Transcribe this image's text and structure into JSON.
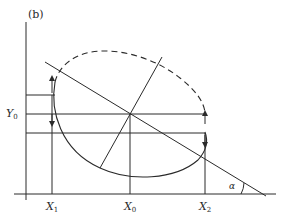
{
  "figure": {
    "panel_label": "(b)",
    "colors": {
      "ink": "#2a2a2a",
      "background": "#ffffff"
    },
    "axes": {
      "x_tick_labels": [
        {
          "base": "X",
          "sub": "1"
        },
        {
          "base": "X",
          "sub": "0"
        },
        {
          "base": "X",
          "sub": "2"
        }
      ],
      "y_tick_labels": [
        {
          "base": "Y",
          "sub": "0"
        }
      ]
    },
    "angle_label": "α",
    "elements": {
      "ellipse_upper": "dashed",
      "ellipse_lower": "solid",
      "diagonal_line": "line sloping down at angle α to x-axis",
      "perpendicular_line": "line through center perpendicular to diagonal",
      "horizontal_guides": 3,
      "vertical_guides": 3,
      "arrows": [
        "up at X1 upper",
        "down at X1 lower",
        "up at X2 upper",
        "down at X2 lower"
      ]
    }
  }
}
